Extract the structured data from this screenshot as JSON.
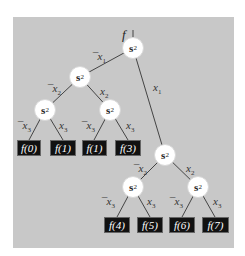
{
  "diagram": {
    "function_label": "f",
    "node_label": "s",
    "node_subscript": "2",
    "edges": {
      "root_left": {
        "label": "x",
        "sub": "1",
        "neg": "¯"
      },
      "root_right": {
        "label": "x",
        "sub": "1",
        "neg": ""
      },
      "l1_left": {
        "label": "x",
        "sub": "2",
        "neg": "¯"
      },
      "l1_right": {
        "label": "x",
        "sub": "2",
        "neg": ""
      },
      "l2a_left": {
        "label": "x",
        "sub": "3",
        "neg": "¯"
      },
      "l2a_right": {
        "label": "x",
        "sub": "3",
        "neg": ""
      },
      "l2b_left": {
        "label": "x",
        "sub": "3",
        "neg": "¯"
      },
      "l2b_right": {
        "label": "x",
        "sub": "3",
        "neg": ""
      },
      "r1_left": {
        "label": "x",
        "sub": "2",
        "neg": "¯"
      },
      "r1_right": {
        "label": "x",
        "sub": "2",
        "neg": ""
      },
      "r2a_left": {
        "label": "x",
        "sub": "3",
        "neg": "¯"
      },
      "r2a_right": {
        "label": "x",
        "sub": "3",
        "neg": ""
      },
      "r2b_left": {
        "label": "x",
        "sub": "3",
        "neg": "¯"
      },
      "r2b_right": {
        "label": "x",
        "sub": "3",
        "neg": ""
      }
    },
    "leaves": [
      "f(0)",
      "f(1)",
      "f(1)",
      "f(3)",
      "f(4)",
      "f(5)",
      "f(6)",
      "f(7)"
    ],
    "colors": {
      "panel": "#c8c8c8",
      "leaf_bg": "#111111",
      "leaf_text": "#ffffff",
      "node_bg": "#ffffff",
      "line": "#444444"
    }
  }
}
